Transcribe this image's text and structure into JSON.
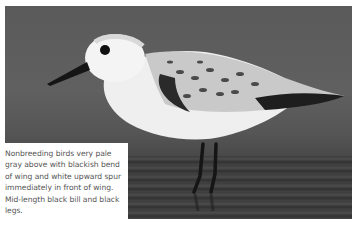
{
  "photo": {
    "subject": "Sanderling (nonbreeding plumage) standing in shallow water",
    "colors": {
      "background": "#5a5a5a",
      "water": "#3c3c3c",
      "body": "#f2f2f2",
      "wing_dark": "#2a2a2a",
      "bill_legs": "#151515"
    }
  },
  "caption": {
    "text": "Nonbreeding birds very pale gray above with blackish bend of wing and white upward spur immediately in front of wing. Mid-length black bill and black legs."
  }
}
